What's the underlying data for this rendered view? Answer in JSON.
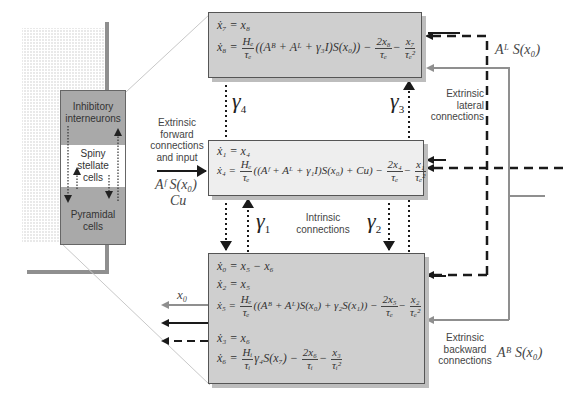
{
  "cortex_column": {
    "layers": [
      {
        "label_line1": "Inhibitory",
        "label_line2": "interneurons",
        "color": "#a9a9a9"
      },
      {
        "label_line1": "Spiny",
        "label_line2": "stellate",
        "label_line3": "cells",
        "color": "#ffffff"
      },
      {
        "label_line1": "Pyramidal",
        "label_line2": "cells",
        "color": "#a9a9a9"
      }
    ]
  },
  "boxes": {
    "inhibitory": {
      "eq1": "ẋ₇ = x₈",
      "eq2_lhs": "ẋ₈ =",
      "eq2_num": "Hₑ",
      "eq2_den": "τₑ",
      "eq2_mid": "((Aᴮ + Aᴸ + γ₃I)S(x₀)) −",
      "eq2_f2_num": "2x₈",
      "eq2_f2_den": "τₑ",
      "eq2_f3_num": "x₇",
      "eq2_f3_den": "τₑ²"
    },
    "stellate": {
      "eq1": "ẋ₁ = x₄",
      "eq2_lhs": "ẋ₄ =",
      "eq2_num": "Hₑ",
      "eq2_den": "τₑ",
      "eq2_mid": "((Aᶠ + Aᴸ + γ₁I)S(x₀) + Cu) −",
      "eq2_f2_num": "2x₄",
      "eq2_f2_den": "τₑ",
      "eq2_f3_num": "x₁",
      "eq2_f3_den": "τₑ²"
    },
    "pyramidal": {
      "eq1": "ẋ₀ = x₅ − x₆",
      "eq2": "ẋ₂ = x₅",
      "eq3_lhs": "ẋ₅ =",
      "eq3_num": "Hₑ",
      "eq3_den": "τₑ",
      "eq3_mid": "((Aᴮ + Aᴸ)S(x₀) + γ₂S(x₁)) −",
      "eq3_f2_num": "2x₅",
      "eq3_f2_den": "τₑ",
      "eq3_f3_num": "x₂",
      "eq3_f3_den": "τₑ²",
      "eq4": "ẋ₃ = x₆",
      "eq5_lhs": "ẋ₆ =",
      "eq5_num": "Hᵢ",
      "eq5_den": "τᵢ",
      "eq5_mid": "γ₄S(x₇) −",
      "eq5_f2_num": "2x₆",
      "eq5_f2_den": "τᵢ",
      "eq5_f3_num": "x₃",
      "eq5_f3_den": "τᵢ²"
    }
  },
  "gammas": {
    "g1": {
      "sym": "γ",
      "sub": "1"
    },
    "g2": {
      "sym": "γ",
      "sub": "2"
    },
    "g3": {
      "sym": "γ",
      "sub": "3"
    },
    "g4": {
      "sym": "γ",
      "sub": "4"
    }
  },
  "labels": {
    "forward": {
      "line1": "Extrinsic",
      "line2": "forward",
      "line3": "connections",
      "line4": "and input"
    },
    "forward_math1": "Aᶠ S(x₀)",
    "forward_math2": "Cu",
    "intrinsic": {
      "line1": "Intrinsic",
      "line2": "connections"
    },
    "lateral": {
      "line1": "Extrinsic",
      "line2": "lateral",
      "line3": "connections"
    },
    "lateral_math": "Aᴸ S(x₀)",
    "backward": {
      "line1": "Extrinsic",
      "line2": "backward",
      "line3": "connections"
    },
    "backward_math": "Aᴮ S(x₀)",
    "output": "x₀"
  },
  "colors": {
    "box_dark": "#cfcfcf",
    "box_light": "#eeeeee",
    "grey_line": "#8f8f8f",
    "black_line": "#1a1a1a"
  }
}
